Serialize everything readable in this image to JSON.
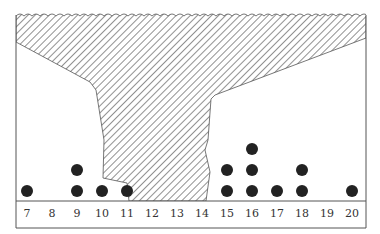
{
  "diagram": {
    "type": "dot-plot-with-hatched-occlusion",
    "colors": {
      "frame": "#555555",
      "hatch": "#555555",
      "dot": "#222222",
      "label": "#333333",
      "background": "#ffffff"
    },
    "axis": {
      "min": 7,
      "max": 20,
      "ticks": [
        "7",
        "8",
        "9",
        "10",
        "11",
        "12",
        "13",
        "14",
        "15",
        "16",
        "17",
        "18",
        "19",
        "20"
      ]
    },
    "dots": [
      {
        "x": 7,
        "count": 1
      },
      {
        "x": 9,
        "count": 2
      },
      {
        "x": 10,
        "count": 1
      },
      {
        "x": 11,
        "count": 1
      },
      {
        "x": 15,
        "count": 2
      },
      {
        "x": 16,
        "count": 3
      },
      {
        "x": 17,
        "count": 1
      },
      {
        "x": 18,
        "count": 2
      },
      {
        "x": 20,
        "count": 1
      }
    ],
    "hatched_region": {
      "description": "Hatched shape hiding values in the 12–14 range, widening toward the top with a wavy top edge",
      "hidden_range": [
        12,
        14
      ]
    }
  }
}
